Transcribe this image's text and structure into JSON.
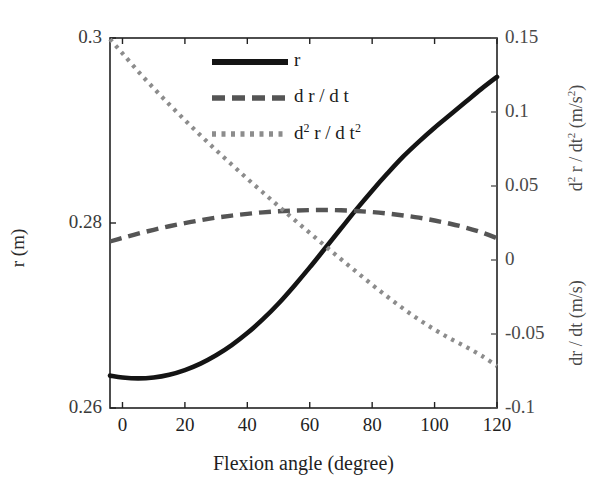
{
  "chart_data": {
    "type": "line",
    "title": "",
    "xlabel": "Flexion angle (degree)",
    "ylabel_left": "r (m)",
    "ylabel_right_top": "d² r / dt² (m/s²)",
    "ylabel_right_bottom": "dr / dt (m/s)",
    "xlim": [
      -4,
      120
    ],
    "xticks": [
      "0",
      "20",
      "40",
      "60",
      "80",
      "100",
      "120"
    ],
    "xtick_values": [
      0,
      20,
      40,
      60,
      80,
      100,
      120
    ],
    "ylim_left": [
      0.26,
      0.3
    ],
    "yticks_left": [
      "0.26",
      "0.28",
      "0.3"
    ],
    "ytick_values_left": [
      0.26,
      0.28,
      0.3
    ],
    "ylim_right": [
      -0.1,
      0.15
    ],
    "yticks_right": [
      "-0.1",
      "-0.05",
      "0",
      "0.05",
      "0.1",
      "0.15"
    ],
    "ytick_values_right": [
      -0.1,
      -0.05,
      0,
      0.05,
      0.1,
      0.15
    ],
    "grid": false,
    "legend_position": "upper center",
    "series": [
      {
        "name": "r",
        "axis": "left",
        "style": "solid",
        "color": "#141414",
        "x": [
          -4,
          0,
          5,
          10,
          15,
          20,
          25,
          30,
          35,
          40,
          45,
          50,
          55,
          60,
          65,
          70,
          75,
          80,
          85,
          90,
          95,
          100,
          105,
          110,
          115,
          120
        ],
        "values": [
          0.2635,
          0.2633,
          0.2632,
          0.2633,
          0.2636,
          0.2641,
          0.2648,
          0.2657,
          0.2668,
          0.2681,
          0.2696,
          0.2713,
          0.2732,
          0.2752,
          0.2773,
          0.2794,
          0.2815,
          0.2835,
          0.2854,
          0.2872,
          0.2888,
          0.2903,
          0.2917,
          0.2931,
          0.2945,
          0.2958
        ]
      },
      {
        "name": "dr / dt",
        "axis": "right",
        "style": "dashed",
        "color": "#555555",
        "x": [
          -4,
          0,
          5,
          10,
          15,
          20,
          25,
          30,
          35,
          40,
          45,
          50,
          55,
          60,
          65,
          70,
          75,
          80,
          85,
          90,
          95,
          100,
          105,
          110,
          115,
          120
        ],
        "values": [
          0.0125,
          0.0149,
          0.0178,
          0.0204,
          0.0228,
          0.0249,
          0.0269,
          0.0286,
          0.03,
          0.0312,
          0.0322,
          0.0329,
          0.0334,
          0.0337,
          0.0338,
          0.0336,
          0.0331,
          0.0324,
          0.0314,
          0.0301,
          0.0286,
          0.0267,
          0.0245,
          0.0219,
          0.0187,
          0.0148
        ]
      },
      {
        "name": "d² r / dt²",
        "axis": "right",
        "style": "dotted",
        "color": "#8c8c8c",
        "x": [
          -4,
          0,
          5,
          10,
          15,
          20,
          25,
          30,
          35,
          40,
          45,
          50,
          55,
          60,
          65,
          70,
          75,
          80,
          85,
          90,
          95,
          100,
          105,
          110,
          115,
          120
        ],
        "values": [
          0.1492,
          0.1396,
          0.1275,
          0.1161,
          0.1051,
          0.0945,
          0.0842,
          0.0742,
          0.0645,
          0.0549,
          0.0456,
          0.0364,
          0.0273,
          0.0183,
          0.0094,
          0.0006,
          -0.0081,
          -0.0167,
          -0.025,
          -0.0329,
          -0.0403,
          -0.047,
          -0.0531,
          -0.0586,
          -0.0646,
          -0.0716
        ]
      }
    ]
  },
  "legend": [
    {
      "label": "r",
      "style": "solid"
    },
    {
      "label": "d r / d t",
      "style": "dashed"
    },
    {
      "label_pre": "d",
      "label_sup": "2",
      "label_mid": " r / d t",
      "label_sup2": "2",
      "style": "dotted"
    }
  ],
  "axes_geometry": {
    "plot_left": 110,
    "plot_right": 497,
    "plot_top": 38,
    "plot_bottom": 408
  }
}
